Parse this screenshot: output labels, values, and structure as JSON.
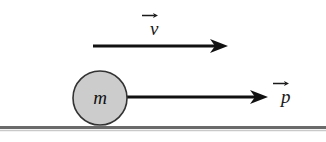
{
  "figure": {
    "background_color": "#ffffff",
    "width": 326,
    "height": 142
  },
  "colors": {
    "ink": "#1a1a1a",
    "arrow": "#111111",
    "ball_fill": "#cccccc",
    "ball_stroke": "#333333",
    "ground": "#6a6a6a",
    "ground_shadow": "#9a9a9a"
  },
  "labels": {
    "velocity": {
      "symbol": "v",
      "accent": "vector-arrow",
      "name": "velocity-vector-label"
    },
    "momentum": {
      "symbol": "p",
      "accent": "vector-arrow",
      "name": "momentum-vector-label"
    },
    "mass": {
      "symbol": "m",
      "name": "mass-label"
    }
  },
  "shapes": {
    "ball": {
      "cx": 100,
      "cy": 98,
      "r": 27,
      "fill": "#cccccc",
      "stroke": "#333333"
    },
    "ground_line": {
      "x1": 0,
      "x2": 326,
      "y": 127,
      "thickness": 3
    },
    "velocity_arrow": {
      "x1": 93,
      "x2": 228,
      "y": 46,
      "head_length": 18,
      "head_width": 14
    },
    "momentum_arrow": {
      "x1": 127,
      "x2": 268,
      "y": 97,
      "head_length": 18,
      "head_width": 14
    }
  }
}
